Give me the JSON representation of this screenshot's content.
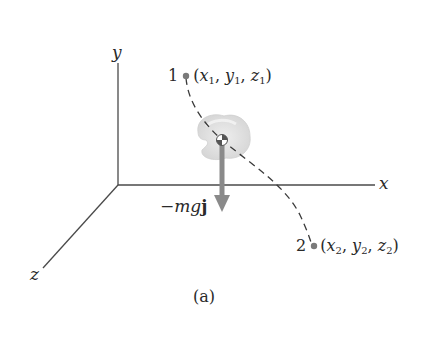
{
  "figure": {
    "caption": "(a)",
    "axes": {
      "x_label": "x",
      "y_label": "y",
      "z_label": "z",
      "color": "#4a4a4a"
    },
    "points": [
      {
        "id": "1",
        "number": "1",
        "coords": [
          "x",
          "1",
          "y",
          "1",
          "z",
          "1"
        ]
      },
      {
        "id": "2",
        "number": "2",
        "coords": [
          "x",
          "2",
          "y",
          "2",
          "z",
          "2"
        ]
      }
    ],
    "force": {
      "label_prefix": "−",
      "label_var": "mg",
      "label_vec": "j",
      "color": "#8a8a8a"
    },
    "path": {
      "style": "dashed",
      "color": "#3a3a3a"
    },
    "body": {
      "color": "#d9d9d9",
      "has_center_of_mass_marker": true
    },
    "point_color": "#7a7a7a"
  }
}
